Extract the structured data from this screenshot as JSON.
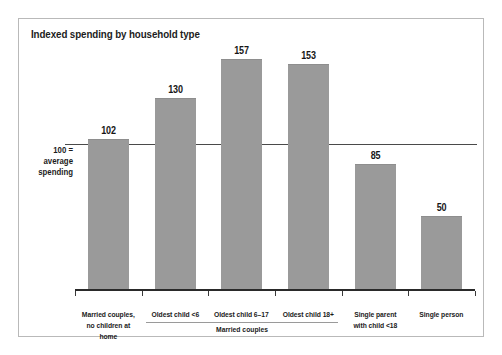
{
  "chart_data": {
    "type": "bar",
    "title": "Indexed spending by household type",
    "xlabel": "",
    "ylabel": "",
    "categories": [
      "Married couples,\nno children at home",
      "Oldest child <6",
      "Oldest child 6–17",
      "Oldest child 18+",
      "Single parent\nwith child <18",
      "Single person"
    ],
    "values": [
      102,
      130,
      157,
      153,
      85,
      50
    ],
    "ylim": [
      0,
      170
    ],
    "grid": false,
    "legend": "none",
    "reference_line": {
      "value": 100,
      "label_line_1": "100 =",
      "label_line_2": "average",
      "label_line_3": "spending"
    },
    "group_bracket": {
      "label": "Married couples",
      "covers": [
        1,
        2,
        3
      ]
    },
    "bar_color": "#9a9a9a",
    "axis_color": "#2a2a2a",
    "border_color": "#b9b9b9",
    "background": "#ffffff"
  },
  "category_labels": [
    {
      "line1": "Married couples,",
      "line2": "no children at home"
    },
    {
      "line1": "Oldest child <6",
      "line2": ""
    },
    {
      "line1": "Oldest child 6–17",
      "line2": ""
    },
    {
      "line1": "Oldest child 18+",
      "line2": ""
    },
    {
      "line1": "Single parent",
      "line2": "with child <18"
    },
    {
      "line1": "Single person",
      "line2": ""
    }
  ],
  "bar_values": [
    "102",
    "130",
    "157",
    "153",
    "85",
    "50"
  ]
}
